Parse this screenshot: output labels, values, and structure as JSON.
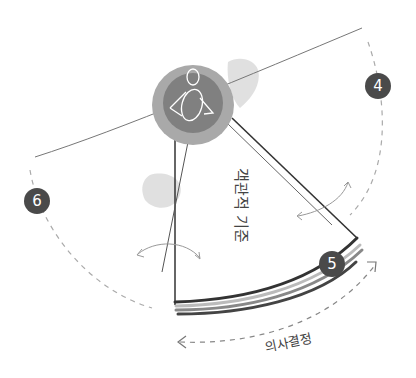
{
  "diagram": {
    "labels": {
      "wedge_label": "객관적 기준",
      "arc_label": "의사결정"
    },
    "badges": [
      {
        "id": "badge-4",
        "number": "4"
      },
      {
        "id": "badge-5",
        "number": "5"
      },
      {
        "id": "badge-6",
        "number": "6"
      }
    ],
    "colors": {
      "badge_fill": "#4a4a4a",
      "circle_outer": "#a8a8a8",
      "circle_inner": "#7e7e7e",
      "line": "#555555",
      "dashed": "#aaaaaa",
      "smudge": "#d6d6d6"
    },
    "icons": {
      "center": "person-with-megaphone-icon"
    }
  }
}
